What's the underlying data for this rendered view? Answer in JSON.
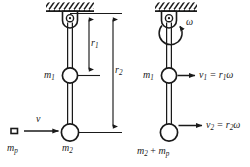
{
  "figure": {
    "type": "physics-free-body-diagram",
    "ink_color": "#1a1a1a",
    "background_color": "#ffffff",
    "panels": [
      {
        "id": "before",
        "name": "before-collision",
        "description": "Rigid rod hanging from a ceiling pivot with mass m1 at radius r1 and mass m2 at radius r2; projectile m_p approaches horizontally with speed v",
        "labels": {
          "m1": "m",
          "m1_sub": "1",
          "m2": "m",
          "m2_sub": "2",
          "mp": "m",
          "mp_sub": "p",
          "v": "v",
          "r1": "r",
          "r1_sub": "1",
          "r2": "r",
          "r2_sub": "2"
        }
      },
      {
        "id": "after",
        "name": "after-collision",
        "description": "Same rod rotating about the pivot with angular velocity omega; mass m1 moves at v1 = r1 omega and combined mass m2 + m_p moves at v2 = r2 omega",
        "labels": {
          "omega": "ω",
          "m1": "m",
          "m1_sub": "1",
          "m2_plus_mp": "m",
          "m2_sub": "2",
          "plus": " + ",
          "mp": "m",
          "mp_sub": "p",
          "v1_eq": "v",
          "v1_sub": "1",
          "v1_rhs_eq": " = r",
          "v1_rhs_sub": "1",
          "v1_rhs_omega": "ω",
          "v2_eq": "v",
          "v2_sub": "2",
          "v2_rhs_eq": " = r",
          "v2_rhs_sub": "2",
          "v2_rhs_omega": "ω"
        }
      }
    ]
  }
}
